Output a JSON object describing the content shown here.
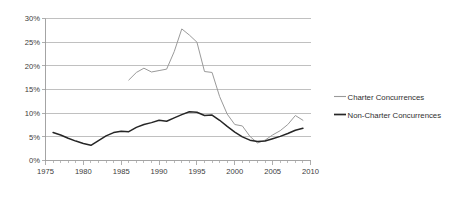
{
  "chart_data": {
    "type": "line",
    "title": "",
    "subtitle": "",
    "xlabel": "",
    "ylabel": "",
    "xlim": [
      1975,
      2010
    ],
    "ylim": [
      0,
      30
    ],
    "y_tick_labels": [
      "0%",
      "5%",
      "10%",
      "15%",
      "20%",
      "25%",
      "30%"
    ],
    "y_tick_values": [
      0,
      5,
      10,
      15,
      20,
      25,
      30
    ],
    "x_tick_labels": [
      "1975",
      "1980",
      "1985",
      "1990",
      "1995",
      "2000",
      "2005",
      "2010"
    ],
    "x_tick_values": [
      1975,
      1980,
      1985,
      1990,
      1995,
      2000,
      2005,
      2010
    ],
    "x_minor_step": 1,
    "grid": "horizontal",
    "legend_position": "right",
    "colors": {
      "charter": "#9a9a9a",
      "non_charter": "#262626",
      "gridline": "#b9b9b9",
      "axis": "#9a9a9a",
      "text": "#3b3b3b",
      "background": "#ffffff"
    },
    "series": [
      {
        "name": "Charter Concurrences",
        "color": "#9a9a9a",
        "x": [
          1986,
          1987,
          1988,
          1989,
          1990,
          1991,
          1992,
          1993,
          1994,
          1995,
          1996,
          1997,
          1998,
          1999,
          2000,
          2001,
          2002,
          2003,
          2004,
          2005,
          2006,
          2007,
          2008,
          2009
        ],
        "values": [
          17.0,
          18.6,
          19.5,
          18.7,
          19.0,
          19.3,
          23.0,
          27.8,
          26.5,
          25.0,
          18.8,
          18.6,
          13.5,
          9.8,
          7.6,
          7.3,
          5.1,
          3.7,
          4.3,
          5.4,
          6.3,
          7.6,
          9.5,
          8.5
        ]
      },
      {
        "name": "Non-Charter Concurrences",
        "color": "#262626",
        "x": [
          1976,
          1977,
          1978,
          1979,
          1980,
          1981,
          1982,
          1983,
          1984,
          1985,
          1986,
          1987,
          1988,
          1989,
          1990,
          1991,
          1992,
          1993,
          1994,
          1995,
          1996,
          1997,
          1998,
          1999,
          2000,
          2001,
          2002,
          2003,
          2004,
          2005,
          2006,
          2007,
          2008,
          2009
        ],
        "values": [
          5.9,
          5.4,
          4.7,
          4.1,
          3.6,
          3.2,
          4.2,
          5.2,
          5.9,
          6.2,
          6.1,
          7.0,
          7.6,
          8.0,
          8.5,
          8.3,
          9.0,
          9.7,
          10.3,
          10.2,
          9.5,
          9.6,
          8.5,
          7.2,
          6.0,
          5.0,
          4.3,
          4.0,
          4.1,
          4.6,
          5.1,
          5.7,
          6.4,
          6.8
        ]
      }
    ]
  },
  "legend": {
    "entries": [
      {
        "label": "Charter Concurrences"
      },
      {
        "label": "Non-Charter Concurrences"
      }
    ]
  }
}
